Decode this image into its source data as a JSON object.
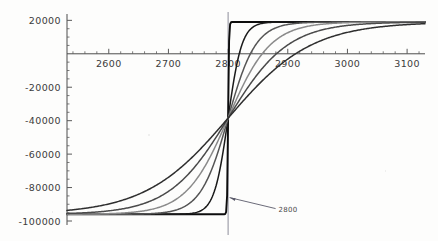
{
  "chart_data": {
    "type": "line",
    "title": "",
    "xlabel": "",
    "ylabel": "",
    "xlim": [
      2530,
      3130
    ],
    "ylim": [
      -100000,
      22000
    ],
    "grid": false,
    "legend": null,
    "x_ticks": [
      2600,
      2700,
      2800,
      2900,
      3000,
      3100
    ],
    "x_tick_labels": [
      "2600",
      "2700",
      "2800",
      "2900",
      "3000",
      "3100"
    ],
    "y_ticks": [
      20000,
      -20000,
      -40000,
      -60000,
      -80000,
      -100000
    ],
    "y_tick_labels": [
      "20000",
      "-20000",
      "-40000",
      "-60000",
      "-80000",
      "-100000"
    ],
    "y_minor_tick_step": 5000,
    "x_minor_tick_step": 20,
    "asymptote_low": -96000,
    "asymptote_high": 19000,
    "midpoint": 2800,
    "annotations": [
      {
        "text": "2800",
        "x": 2800,
        "y": -86000,
        "arrow": "points-up-left-to-vertical-line",
        "color": "#5a5a6a"
      }
    ],
    "vertical_line": {
      "x": 2800,
      "color": "#8d8d9a",
      "label": "2800"
    },
    "series": [
      {
        "name": "k = very steep (step)",
        "steepness": 400,
        "color": "#0d0d0d",
        "width": 1.9,
        "values_note": "near-ideal step from -96000 to 19000 at x=2800"
      },
      {
        "name": "k = steep",
        "steepness": 26,
        "color": "#1a1a1a",
        "width": 1.5
      },
      {
        "name": "k = medium-steep",
        "steepness": 13,
        "color": "#555555",
        "width": 1.5
      },
      {
        "name": "k = medium",
        "steepness": 8.5,
        "color": "#8a8a8a",
        "width": 1.5
      },
      {
        "name": "k = shallow",
        "steepness": 6.0,
        "color": "#4a4a4a",
        "width": 1.5
      },
      {
        "name": "k = very shallow",
        "steepness": 4.3,
        "color": "#2e2e2e",
        "width": 1.5
      }
    ]
  },
  "axes": {
    "x_axis_color": "#4d4d4d",
    "y_axis_color": "#4d4d4d",
    "tick_color": "#5a5a5a"
  }
}
